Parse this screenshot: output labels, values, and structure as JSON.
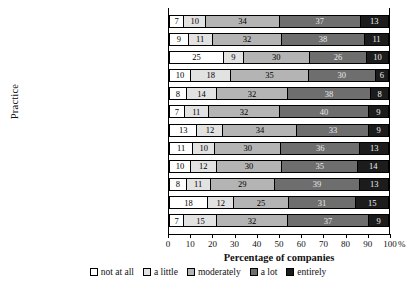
{
  "chart_data": {
    "type": "bar",
    "orientation": "horizontal",
    "stacked": true,
    "stack_mode": "percent",
    "title": "",
    "xlabel": "Percentage of companies",
    "ylabel": "Practice",
    "xlim": [
      0,
      100
    ],
    "xunit": "%",
    "xticks": [
      0,
      10,
      20,
      30,
      40,
      50,
      60,
      70,
      80,
      90,
      100
    ],
    "xticklabels": [
      "0",
      "10",
      "20",
      "30",
      "40",
      "50",
      "60",
      "70",
      "80",
      "90",
      "100"
    ],
    "grid": false,
    "legend_position": "bottom",
    "legend": [
      "not at all",
      "a little",
      "moderately",
      "a lot",
      "entirely"
    ],
    "series": [
      {
        "name": "not at all",
        "color": "#ffffff",
        "values": [
          7,
          9,
          25,
          10,
          8,
          7,
          13,
          11,
          10,
          8,
          18,
          7
        ]
      },
      {
        "name": "a little",
        "color": "#e2e2e2",
        "values": [
          10,
          11,
          9,
          18,
          14,
          11,
          12,
          10,
          12,
          11,
          12,
          15
        ]
      },
      {
        "name": "moderately",
        "color": "#b4b4b4",
        "values": [
          34,
          32,
          30,
          35,
          32,
          32,
          34,
          30,
          30,
          29,
          25,
          32
        ]
      },
      {
        "name": "a lot",
        "color": "#6e6e6e",
        "values": [
          37,
          38,
          26,
          30,
          38,
          40,
          33,
          36,
          35,
          39,
          31,
          37
        ]
      },
      {
        "name": "entirely",
        "color": "#1c1c1c",
        "values": [
          13,
          11,
          10,
          6,
          8,
          9,
          9,
          13,
          14,
          13,
          15,
          9
        ]
      }
    ],
    "categories": [
      "Business process re-engineering",
      "Supply-chain partnering",
      "",
      "Learning culture",
      "",
      "Team-based working",
      "",
      "Concurrent engineering",
      "",
      "Manufacturing cells",
      "",
      "Total quality management"
    ]
  }
}
